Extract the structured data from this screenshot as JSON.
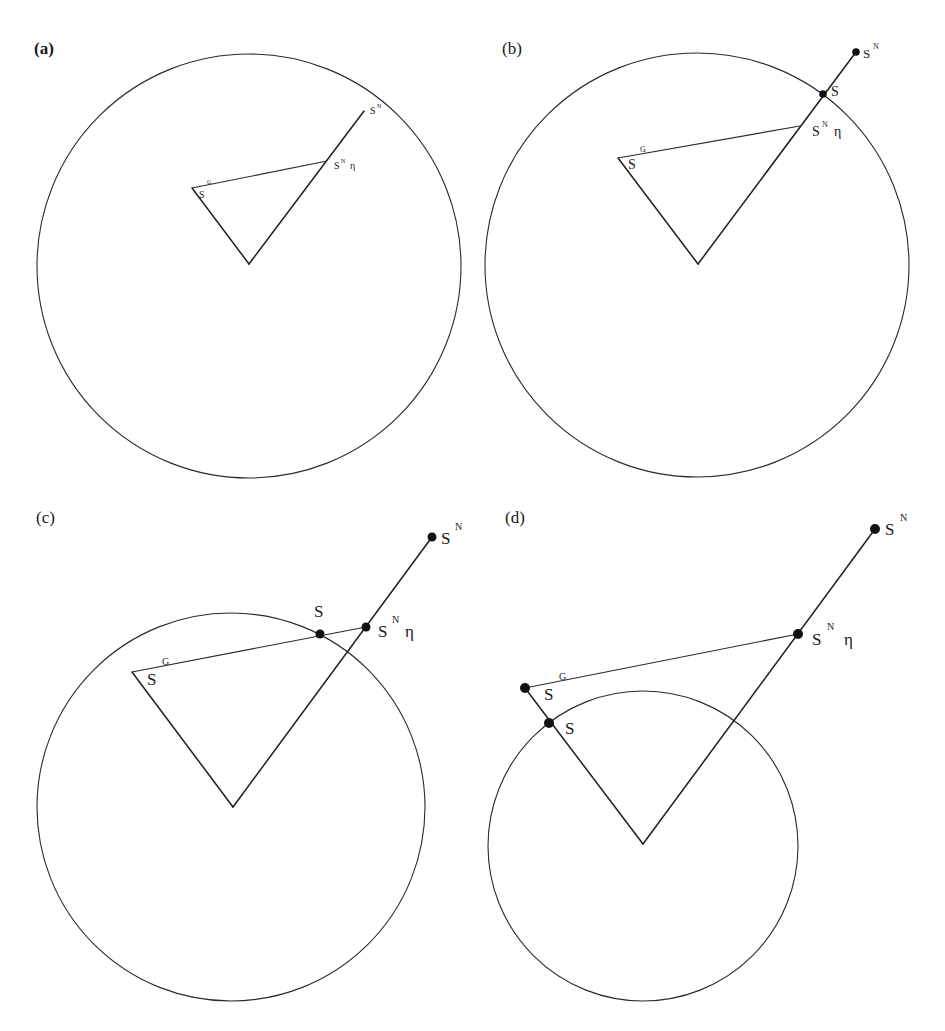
{
  "figure": {
    "panels": [
      {
        "id": "a",
        "label": "(a)",
        "circle": {
          "cx": 249,
          "cy": 266,
          "r": 212
        },
        "apex": [
          249,
          264
        ],
        "points": {
          "SG": {
            "x": 192,
            "y": 188,
            "dot": false,
            "base": "S",
            "sup": "G"
          },
          "SNeta": {
            "x": 327,
            "y": 161,
            "dot": false,
            "base": "S",
            "sup": "N",
            "suffix": "η"
          },
          "SN": {
            "x": 364,
            "y": 111,
            "dot": false,
            "base": "S",
            "sup": "N"
          }
        }
      },
      {
        "id": "b",
        "label": "(b)",
        "circle": {
          "cx": 697,
          "cy": 265,
          "r": 212
        },
        "apex": [
          698,
          264
        ],
        "points": {
          "SG": {
            "x": 618,
            "y": 158,
            "dot": false,
            "base": "S",
            "sup": "G"
          },
          "SNeta": {
            "x": 800,
            "y": 126,
            "dot": false,
            "base": "S",
            "sup": "N",
            "suffix": "η"
          },
          "S": {
            "x": 823,
            "y": 94,
            "dot": true,
            "base": "S"
          },
          "SN": {
            "x": 856,
            "y": 52,
            "dot": true,
            "base": "S",
            "sup": "N"
          }
        }
      },
      {
        "id": "c",
        "label": "(c)",
        "circle": {
          "cx": 231,
          "cy": 807,
          "r": 194
        },
        "apex": [
          233,
          807
        ],
        "points": {
          "SG": {
            "x": 132,
            "y": 672,
            "dot": false,
            "base": "S",
            "sup": "G"
          },
          "S": {
            "x": 320,
            "y": 634,
            "dot": true,
            "base": "S"
          },
          "SNeta": {
            "x": 366,
            "y": 627,
            "dot": true,
            "base": "S",
            "sup": "N",
            "suffix": "η"
          },
          "SN": {
            "x": 432,
            "y": 537,
            "dot": true,
            "base": "S",
            "sup": "N"
          }
        }
      },
      {
        "id": "d",
        "label": "(d)",
        "circle": {
          "cx": 643,
          "cy": 846,
          "r": 155
        },
        "apex": [
          643,
          844
        ],
        "points": {
          "SG": {
            "x": 525,
            "y": 688,
            "dot": true,
            "base": "S",
            "sup": "G"
          },
          "S": {
            "x": 549,
            "y": 723,
            "dot": true,
            "base": "S"
          },
          "SNeta": {
            "x": 798,
            "y": 634,
            "dot": true,
            "base": "S",
            "sup": "N",
            "suffix": "η"
          },
          "SN": {
            "x": 875,
            "y": 529,
            "dot": true,
            "base": "S",
            "sup": "N"
          }
        }
      }
    ]
  }
}
